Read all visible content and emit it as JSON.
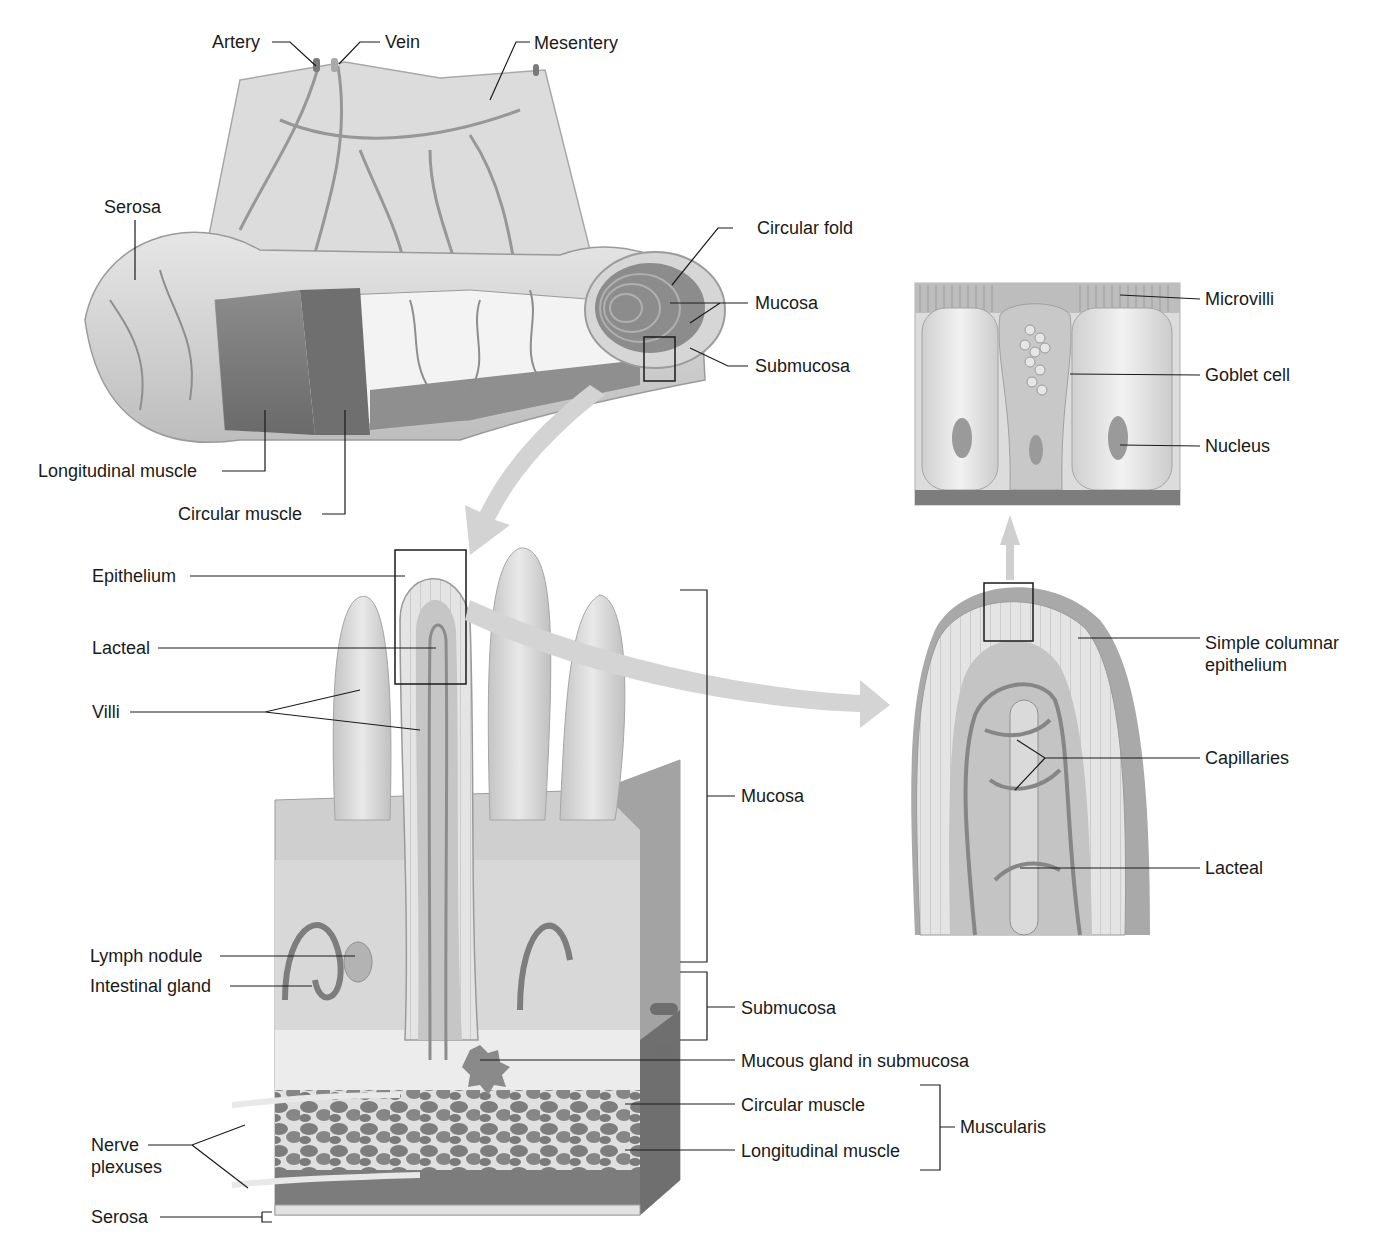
{
  "figure": {
    "colors": {
      "background": "#ffffff",
      "tissue_light": "#dcdcdc",
      "tissue_mid": "#b8b8b8",
      "muscle_dark": "#7a7a7a",
      "vessel": "#8a8a8a",
      "arrow": "#cfcfcf",
      "leader_line": "#1a1a1a"
    }
  },
  "panels": {
    "intestine_overview": {
      "labels": {
        "artery": "Artery",
        "vein": "Vein",
        "mesentery": "Mesentery",
        "serosa": "Serosa",
        "circular_fold": "Circular fold",
        "mucosa": "Mucosa",
        "submucosa": "Submucosa",
        "longitudinal_muscle": "Longitudinal muscle",
        "circular_muscle": "Circular muscle"
      }
    },
    "wall_section": {
      "labels": {
        "epithelium": "Epithelium",
        "lacteal": "Lacteal",
        "villi": "Villi",
        "mucosa": "Mucosa",
        "lymph_nodule": "Lymph nodule",
        "intestinal_gland": "Intestinal gland",
        "submucosa": "Submucosa",
        "mucous_gland": "Mucous gland in submucosa",
        "circular_muscle": "Circular muscle",
        "longitudinal_muscle": "Longitudinal muscle",
        "muscularis": "Muscularis",
        "nerve_plexuses": "Nerve plexuses",
        "serosa": "Serosa"
      }
    },
    "epithelium_detail": {
      "labels": {
        "microvilli": "Microvilli",
        "goblet_cell": "Goblet cell",
        "nucleus": "Nucleus"
      }
    },
    "villus_detail": {
      "labels": {
        "simple_columnar_epithelium": "Simple columnar epithelium",
        "capillaries": "Capillaries",
        "lacteal": "Lacteal"
      }
    }
  }
}
